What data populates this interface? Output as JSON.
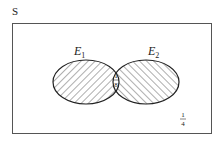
{
  "diagram": {
    "type": "venn",
    "universe_label": "S",
    "sets": [
      {
        "name": "E",
        "subscript": "1",
        "hatch": "diagonal-forward"
      },
      {
        "name": "E",
        "subscript": "2",
        "hatch": "diagonal-backward"
      }
    ],
    "intersection": {
      "numerator": "1",
      "denominator": "8"
    },
    "outside": {
      "numerator": "1",
      "denominator": "4"
    }
  }
}
